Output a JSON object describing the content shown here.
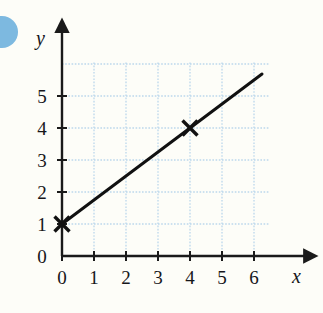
{
  "figure": {
    "background_color": "#fdfdf8",
    "grid_color": "#bcd8ec",
    "axis_color": "#1a1a1a",
    "line_color": "#111111",
    "marker_color": "#111111",
    "decoration_color": "#7db9e0"
  },
  "axes": {
    "x_axis_label": "x",
    "y_axis_label": "y",
    "x_tick_labels": [
      "0",
      "1",
      "2",
      "3",
      "4",
      "5",
      "6"
    ],
    "y_tick_labels": [
      "0",
      "1",
      "2",
      "3",
      "4",
      "5"
    ],
    "origin_label": "0"
  },
  "chart_data": {
    "type": "line",
    "title": "",
    "subtitle": "",
    "xlabel": "x",
    "ylabel": "y",
    "xlim": [
      0,
      6.6
    ],
    "ylim": [
      0,
      6.3
    ],
    "xticks": [
      0,
      1,
      2,
      3,
      4,
      5,
      6
    ],
    "yticks": [
      0,
      1,
      2,
      3,
      4,
      5
    ],
    "grid": true,
    "grid_style": "dotted",
    "legend": null,
    "legend_position": "none",
    "series": [
      {
        "name": "line",
        "equation": "y = 0.75x + 1",
        "slope": 0.75,
        "intercept": 1,
        "x": [
          0,
          6.25
        ],
        "y": [
          1,
          5.6875
        ],
        "style": "solid",
        "width": 3
      }
    ],
    "annotations": [
      {
        "type": "marker",
        "shape": "x",
        "x": 0,
        "y": 1,
        "label": ""
      },
      {
        "type": "marker",
        "shape": "x",
        "x": 4,
        "y": 4,
        "label": ""
      }
    ]
  }
}
